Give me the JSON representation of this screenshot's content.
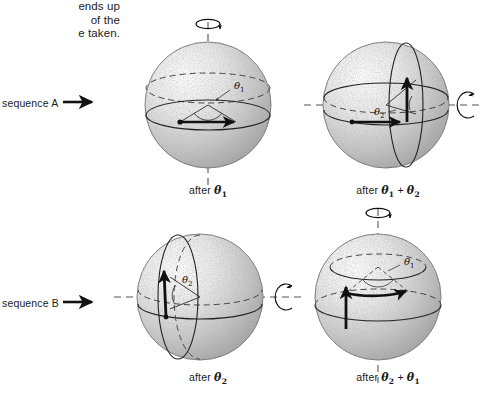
{
  "figure": {
    "kind": "physics-diagram",
    "intro_text_lines": [
      "ends up",
      "of the",
      "e taken."
    ]
  },
  "sequences": [
    {
      "id": "A",
      "label": "sequence A",
      "arrow_icon": "right-arrow-icon"
    },
    {
      "id": "B",
      "label": "sequence B",
      "arrow_icon": "right-arrow-icon"
    }
  ],
  "panels": [
    {
      "id": "panel-1",
      "row": "A",
      "caption_prefix": "after",
      "caption_terms": [
        "θ"
      ],
      "caption_subs": [
        "1"
      ],
      "angle_label": "θ",
      "angle_sub": "1",
      "axis": "vertical",
      "axis_style": "dashed",
      "spin_icon": "rotation-arrow-vertical-icon"
    },
    {
      "id": "panel-2",
      "row": "A",
      "caption_prefix": "after",
      "caption_terms": [
        "θ",
        "θ"
      ],
      "caption_subs": [
        "1",
        "2"
      ],
      "caption_operator": "+",
      "angle_label": "θ",
      "angle_sub": "2",
      "axis": "horizontal",
      "axis_style": "dashed",
      "spin_icon": "rotation-arrow-horizontal-icon"
    },
    {
      "id": "panel-3",
      "row": "B",
      "caption_prefix": "after",
      "caption_terms": [
        "θ"
      ],
      "caption_subs": [
        "2"
      ],
      "angle_label": "θ",
      "angle_sub": "2",
      "axis": "horizontal",
      "axis_style": "dashed",
      "spin_icon": "rotation-arrow-horizontal-icon"
    },
    {
      "id": "panel-4",
      "row": "B",
      "caption_prefix": "after",
      "caption_terms": [
        "θ",
        "θ"
      ],
      "caption_subs": [
        "2",
        "1"
      ],
      "caption_operator": "+",
      "angle_label": "θ",
      "angle_sub": "1",
      "axis": "vertical",
      "axis_style": "dashed",
      "spin_icon": "rotation-arrow-vertical-icon"
    }
  ],
  "colors": {
    "background": "#ffffff",
    "ink": "#1a1a1a",
    "sphere_light": "#f2f2f2",
    "sphere_mid": "#cfcfcf",
    "sphere_dark": "#9a9a9a",
    "dashed": "#555555"
  }
}
